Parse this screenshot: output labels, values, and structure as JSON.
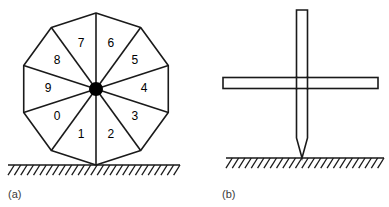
{
  "figure": {
    "background_color": "#ffffff",
    "stroke_color": "#1a1a1a",
    "hub_color": "#000000",
    "caption_color": "#3a3a3a",
    "panels": [
      {
        "id": "panel-a",
        "caption": "(a)",
        "caption_x": 8,
        "caption_y": 198,
        "type": "segmented-decagon-wheel",
        "wheel": {
          "center_x": 96,
          "center_y": 89,
          "radius": 76,
          "sides": 10,
          "start_angle_deg": 18,
          "hub_radius": 7,
          "sector_labels": [
            "0",
            "1",
            "2",
            "3",
            "4",
            "5",
            "6",
            "7",
            "8",
            "9"
          ],
          "label_radius": 48
        },
        "ground": {
          "y": 165,
          "x_start": 8,
          "x_end": 180,
          "hatch_count": 27,
          "hatch_length": 12,
          "hatch_angle_deg": 58
        }
      },
      {
        "id": "panel-b",
        "caption": "(b)",
        "caption_x": 222,
        "caption_y": 198,
        "type": "cross-rod-and-bar",
        "rod": {
          "center_x": 302,
          "top_y": 10,
          "tip_y": 158,
          "taper_start_y": 138,
          "width": 11
        },
        "bar": {
          "x_start": 223,
          "x_end": 378,
          "center_y": 83,
          "height": 11
        },
        "ground": {
          "y": 158,
          "x_start": 226,
          "x_end": 384,
          "hatch_count": 25,
          "hatch_length": 12,
          "hatch_angle_deg": 58
        }
      }
    ]
  }
}
